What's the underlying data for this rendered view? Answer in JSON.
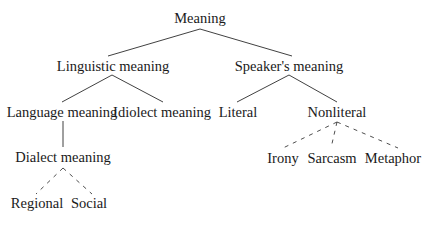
{
  "diagram": {
    "type": "tree",
    "title": "Meaning",
    "nodes": {
      "root": "Meaning",
      "linguistic": "Linguistic meaning",
      "speaker": "Speaker's meaning",
      "language": "Language meaning",
      "idiolect": "Idiolect meaning",
      "literal": "Literal",
      "nonliteral": "Nonliteral",
      "dialect": "Dialect meaning",
      "regional": "Regional",
      "social": "Social",
      "irony": "Irony",
      "sarcasm": "Sarcasm",
      "metaphor": "Metaphor"
    },
    "edges": [
      {
        "from": "Meaning",
        "to": "Linguistic meaning",
        "style": "solid"
      },
      {
        "from": "Meaning",
        "to": "Speaker's meaning",
        "style": "solid"
      },
      {
        "from": "Linguistic meaning",
        "to": "Language meaning",
        "style": "solid"
      },
      {
        "from": "Linguistic meaning",
        "to": "Idiolect meaning",
        "style": "solid"
      },
      {
        "from": "Speaker's meaning",
        "to": "Literal",
        "style": "solid"
      },
      {
        "from": "Speaker's meaning",
        "to": "Nonliteral",
        "style": "solid"
      },
      {
        "from": "Language meaning",
        "to": "Dialect meaning",
        "style": "solid"
      },
      {
        "from": "Dialect meaning",
        "to": "Regional",
        "style": "dashed"
      },
      {
        "from": "Dialect meaning",
        "to": "Social",
        "style": "dashed"
      },
      {
        "from": "Nonliteral",
        "to": "Irony",
        "style": "dashed"
      },
      {
        "from": "Nonliteral",
        "to": "Sarcasm",
        "style": "dashed"
      },
      {
        "from": "Nonliteral",
        "to": "Metaphor",
        "style": "dashed"
      }
    ],
    "colors": {
      "text": "#1a1a1a",
      "line": "#2b2b2b",
      "background": "#ffffff"
    }
  }
}
